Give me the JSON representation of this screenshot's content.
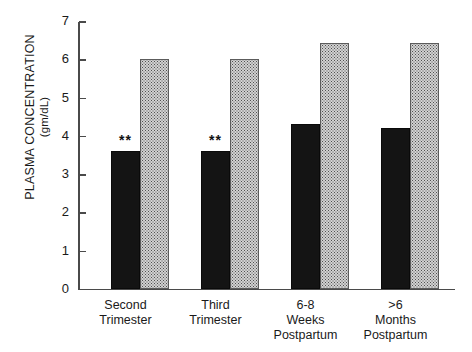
{
  "chart_data": {
    "type": "bar",
    "title": "",
    "subtitle": "",
    "xlabel": "",
    "ylabel": "PLASMA CONCENTRATION",
    "ylabel_units": "(gm/dL)",
    "categories": [
      "Second Trimester",
      "Third Trimester",
      "6-8 Weeks Postpartum",
      ">6 Months Postpartum"
    ],
    "category_lines": [
      [
        "Second",
        "Trimester"
      ],
      [
        "Third",
        "Trimester"
      ],
      [
        "6-8",
        "Weeks",
        "Postpartum"
      ],
      [
        ">6",
        "Months",
        "Postpartum"
      ]
    ],
    "series": [
      {
        "name": "solid-black-series",
        "fill": "solid-black",
        "color": "#141414",
        "values": [
          3.6,
          3.6,
          4.3,
          4.2
        ]
      },
      {
        "name": "stippled-gray-series",
        "fill": "stippled-gray",
        "color": "#d2d2d2",
        "values": [
          6.0,
          6.0,
          6.4,
          6.4
        ]
      }
    ],
    "annotations": [
      {
        "category_index": 0,
        "series_index": 0,
        "text": "**"
      },
      {
        "category_index": 1,
        "series_index": 0,
        "text": "**"
      }
    ],
    "ylim": [
      0,
      7
    ],
    "yticks": [
      0,
      1,
      2,
      3,
      4,
      5,
      6,
      7
    ],
    "ytick_labels": [
      "0",
      "1",
      "2",
      "3",
      "4",
      "5",
      "6",
      "7"
    ],
    "grid": false,
    "legend": false,
    "legend_position": "none",
    "axis_color": "#4a4a4a"
  }
}
